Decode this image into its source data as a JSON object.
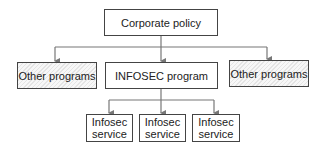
{
  "diagram": {
    "root": {
      "label": "Corporate policy"
    },
    "level2": [
      {
        "label": "Other programs",
        "style": "hatched"
      },
      {
        "label": "INFOSEC program",
        "style": "plain"
      },
      {
        "label": "Other programs",
        "style": "hatched"
      }
    ],
    "level3": [
      {
        "label": "Infosec service"
      },
      {
        "label": "Infosec service"
      },
      {
        "label": "Infosec service"
      }
    ],
    "colors": {
      "line": "#777777",
      "border": "#444444",
      "hatch": "#e4e4e4"
    }
  }
}
